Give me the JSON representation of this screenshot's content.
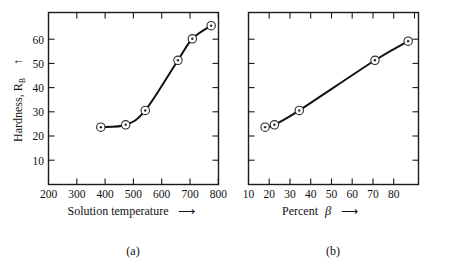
{
  "figure": {
    "background_color": "#ffffff",
    "ink_color": "#111111"
  },
  "chart_data": [
    {
      "type": "line",
      "panel": "(a)",
      "title": "",
      "xlabel": "Solution temperature",
      "xlabel_arrow": "⟶",
      "ylabel": "Hardness, R",
      "ylabel_subscript": "B",
      "ylabel_arrow": "↑",
      "x": [
        400,
        495,
        570,
        695,
        750,
        822
      ],
      "values": [
        24,
        25,
        31,
        52,
        61,
        66.5
      ],
      "xticks": [
        200,
        300,
        400,
        500,
        600,
        700,
        800
      ],
      "yticks": [
        10,
        20,
        30,
        40,
        50,
        60
      ],
      "xlim": [
        200,
        850
      ],
      "ylim": [
        0,
        72
      ],
      "grid": false,
      "marker": "open-circle-with-dot",
      "legend": "none"
    },
    {
      "type": "line",
      "panel": "(b)",
      "title": "",
      "xlabel": "Percent",
      "xlabel_symbol": "β",
      "xlabel_arrow": "⟶",
      "ylabel": "",
      "x": [
        18,
        22.5,
        34.5,
        71,
        87
      ],
      "values": [
        24,
        25,
        31,
        52,
        60
      ],
      "xticks": [
        10,
        20,
        30,
        40,
        50,
        60,
        70,
        80
      ],
      "yticks": [
        10,
        20,
        30,
        40,
        50,
        60
      ],
      "ytick_labels_shown": false,
      "xlim": [
        10,
        92
      ],
      "ylim": [
        0,
        72
      ],
      "grid": false,
      "marker": "open-circle-with-dot",
      "legend": "none"
    }
  ],
  "panel_a": {
    "caption": "(a)",
    "xlabel": "Solution temperature",
    "arrow": "⟶",
    "ylabel_main": "Hardness, R",
    "ylabel_sub": "B",
    "yarrow": "↑",
    "xticks": [
      "200",
      "300",
      "400",
      "500",
      "600",
      "700",
      "800"
    ],
    "yticks": [
      "60",
      "50",
      "40",
      "30",
      "20",
      "10"
    ]
  },
  "panel_b": {
    "caption": "(b)",
    "xlabel_word": "Percent",
    "xlabel_symbol": "β",
    "arrow": "⟶",
    "xticks": [
      "10",
      "20",
      "30",
      "40",
      "50",
      "60",
      "70",
      "80"
    ]
  }
}
